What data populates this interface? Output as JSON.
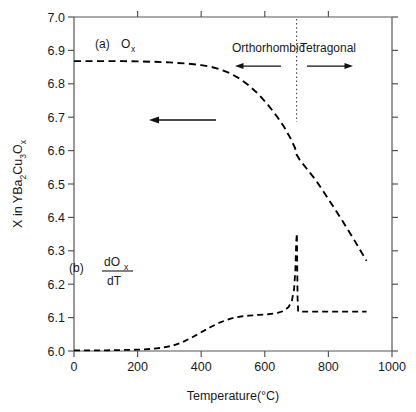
{
  "chart_data": {
    "type": "line",
    "title": "",
    "xlabel": "Temperature(°C)",
    "ylabel": "X in YBa₂2Cu₂3Oₓ",
    "ylabel_parts": {
      "prefix": "X in YBa",
      "sub1": "2",
      "mid": "Cu",
      "sub2": "3",
      "suffix": "O",
      "sub3": "x"
    },
    "xlim": [
      0,
      1000
    ],
    "ylim": [
      6.0,
      7.0
    ],
    "xticks": [
      0,
      200,
      400,
      600,
      800,
      1000
    ],
    "xtick_labels": [
      "0",
      "200",
      "400",
      "600",
      "800",
      "1000"
    ],
    "yticks": [
      6.0,
      6.1,
      6.2,
      6.3,
      6.4,
      6.5,
      6.6,
      6.7,
      6.8,
      6.9,
      7.0
    ],
    "ytick_labels": [
      "6.0",
      "6.1",
      "6.2",
      "6.3",
      "6.4",
      "6.5",
      "6.6",
      "6.7",
      "6.8",
      "6.9",
      "7.0"
    ],
    "grid": false,
    "legend": "none",
    "line_style": "dashed",
    "line_color": "#000000",
    "series": [
      {
        "name": "(a) Ox",
        "label_text": "(a) O",
        "label_sub": "x",
        "x": [
          0,
          50,
          100,
          150,
          200,
          250,
          300,
          350,
          400,
          430,
          460,
          490,
          520,
          550,
          580,
          610,
          640,
          660,
          680,
          695,
          700,
          710,
          730,
          760,
          800,
          840,
          880,
          920
        ],
        "y": [
          6.868,
          6.868,
          6.868,
          6.868,
          6.867,
          6.866,
          6.864,
          6.861,
          6.856,
          6.851,
          6.843,
          6.832,
          6.816,
          6.795,
          6.769,
          6.737,
          6.7,
          6.672,
          6.638,
          6.608,
          6.588,
          6.572,
          6.548,
          6.512,
          6.455,
          6.396,
          6.334,
          6.27
        ]
      },
      {
        "name": "(b) dOx/dT",
        "label_text": "(b)",
        "label_num": "dO",
        "label_num_sub": "x",
        "label_den": "dT",
        "x": [
          0,
          50,
          100,
          150,
          200,
          240,
          280,
          310,
          340,
          370,
          400,
          430,
          460,
          490,
          510,
          530,
          550,
          580,
          610,
          640,
          660,
          675,
          685,
          692,
          696,
          699,
          701,
          702,
          703,
          705,
          720,
          760,
          800,
          850,
          900,
          920
        ],
        "y": [
          6.002,
          6.002,
          6.002,
          6.003,
          6.004,
          6.006,
          6.01,
          6.016,
          6.026,
          6.04,
          6.056,
          6.072,
          6.086,
          6.096,
          6.101,
          6.104,
          6.106,
          6.108,
          6.11,
          6.114,
          6.12,
          6.132,
          6.15,
          6.185,
          6.24,
          6.33,
          6.352,
          6.25,
          6.16,
          6.118,
          6.118,
          6.118,
          6.118,
          6.118,
          6.118,
          6.118
        ]
      }
    ],
    "annotations": [
      {
        "name": "orthorhombic-label",
        "text": "Orthorhombic",
        "x": 470,
        "y": 6.93
      },
      {
        "name": "tetragonal-label",
        "text": "Tetragonal",
        "x": 800,
        "y": 6.93
      },
      {
        "name": "phase-boundary-line",
        "text": "",
        "x": 700,
        "style": "dotted-vertical"
      },
      {
        "name": "orthorhombic-arrow",
        "direction": "left",
        "x_from": 640,
        "x_to": 510,
        "y": 6.875
      },
      {
        "name": "tetragonal-arrow",
        "direction": "right",
        "x_from": 730,
        "x_to": 865,
        "y": 6.875
      },
      {
        "name": "cooling-direction-arrow",
        "direction": "left",
        "x_from": 455,
        "x_to": 265,
        "y": 6.7
      }
    ]
  },
  "labels": {
    "series_a_prefix": "(a)",
    "series_a_symbol": "O",
    "series_a_sub": "x",
    "series_b_prefix": "(b)",
    "series_b_numerator": "dO",
    "series_b_numerator_sub": "x",
    "series_b_denominator": "dT",
    "orthorhombic": "Orthorhombic",
    "tetragonal": "Tetragonal",
    "xaxis": "Temperature(°C)",
    "yaxis_prefix": "X in YBa",
    "yaxis_sub1": "2",
    "yaxis_mid": "Cu",
    "yaxis_sub2": "3",
    "yaxis_o": "O",
    "yaxis_sub3": "x"
  },
  "ticks": {
    "x": [
      "0",
      "200",
      "400",
      "600",
      "800",
      "1000"
    ],
    "y": [
      "6.0",
      "6.1",
      "6.2",
      "6.3",
      "6.4",
      "6.5",
      "6.6",
      "6.7",
      "6.8",
      "6.9",
      "7.0"
    ]
  },
  "colors": {
    "line": "#000000",
    "axis": "#555555",
    "text": "#1a1a1a",
    "background": "#ffffff"
  }
}
